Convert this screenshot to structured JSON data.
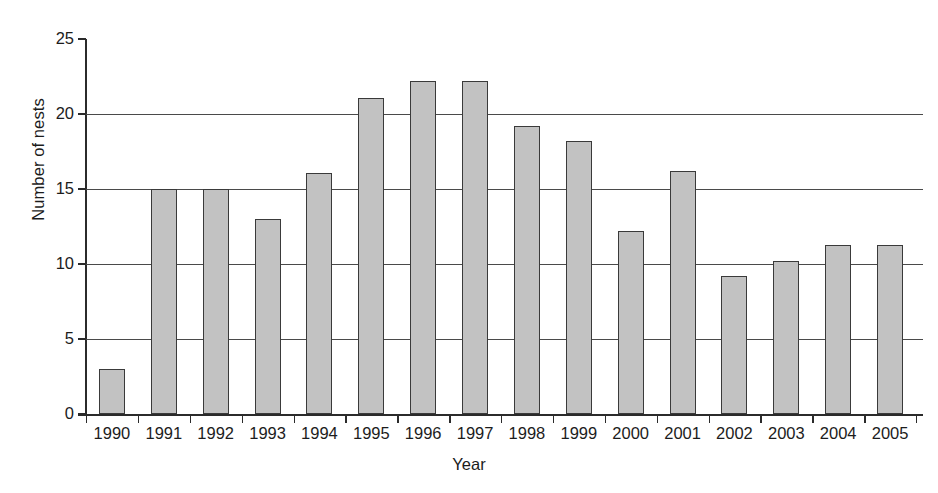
{
  "chart_data": {
    "type": "bar",
    "title": "",
    "xlabel": "Year",
    "ylabel": "Number of nests",
    "categories": [
      "1990",
      "1991",
      "1992",
      "1993",
      "1994",
      "1995",
      "1996",
      "1997",
      "1998",
      "1999",
      "2000",
      "2001",
      "2002",
      "2003",
      "2004",
      "2005"
    ],
    "values": [
      3.0,
      15.0,
      15.0,
      13.0,
      16.1,
      21.1,
      22.2,
      22.2,
      19.2,
      18.2,
      12.2,
      16.2,
      9.2,
      10.2,
      11.3,
      11.3
    ],
    "ylim": [
      0,
      25
    ],
    "yticks": [
      0,
      5,
      10,
      15,
      20,
      25
    ],
    "ytick_labels": [
      "0",
      "5",
      "10",
      "15",
      "20",
      "25"
    ],
    "grid": "horizontal",
    "legend": "none",
    "bar_fill_color": "#c2c2c2",
    "bar_edge_color": "#3a3a3a",
    "axis_color": "#2b2b2b",
    "gridline_color": "#4a4a4a"
  }
}
